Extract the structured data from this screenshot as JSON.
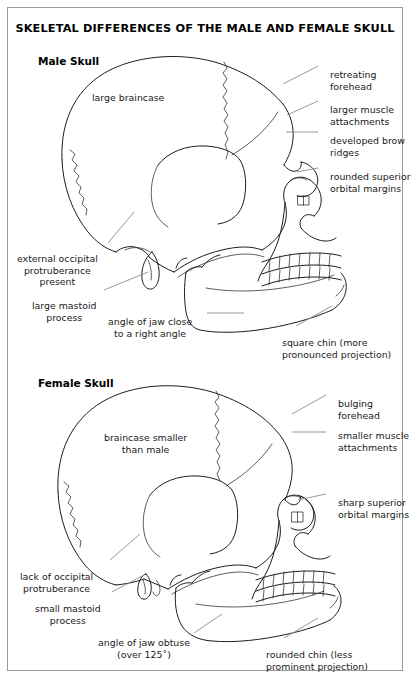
{
  "figure": {
    "title": "SKELETAL DIFFERENCES OF THE MALE AND FEMALE SKULL",
    "border_color": "#9a9a9a",
    "ink_color": "#1d1d1d",
    "leader_color": "#8d8d8d",
    "background": "#ffffff"
  },
  "panels": [
    {
      "id": "male",
      "heading": "Male Skull",
      "internal_labels": [
        {
          "name": "large-braincase",
          "text": "large braincase"
        }
      ],
      "callouts": [
        {
          "name": "retreating-forehead",
          "text": "retreating\nforehead",
          "side": "right"
        },
        {
          "name": "larger-muscle-attachments",
          "text": "larger muscle\nattachments",
          "side": "right"
        },
        {
          "name": "developed-brow-ridges",
          "text": "developed brow\nridges",
          "side": "right"
        },
        {
          "name": "rounded-superior-orbital-margins",
          "text": "rounded superior\norbital margins",
          "side": "right"
        },
        {
          "name": "external-occipital-protruberance",
          "text": "external occipital\nprotruberance\npresent",
          "side": "left"
        },
        {
          "name": "large-mastoid-process",
          "text": "large mastoid\nprocess",
          "side": "left"
        },
        {
          "name": "angle-of-jaw-right-angle",
          "text": "angle of jaw close\nto a right angle",
          "side": "left"
        },
        {
          "name": "square-chin",
          "text": "square chin (more\npronounced projection)",
          "side": "right"
        }
      ]
    },
    {
      "id": "female",
      "heading": "Female Skull",
      "internal_labels": [
        {
          "name": "braincase-smaller-than-male",
          "text": "braincase smaller\nthan male"
        }
      ],
      "callouts": [
        {
          "name": "bulging-forehead",
          "text": "bulging\nforehead",
          "side": "right"
        },
        {
          "name": "smaller-muscle-attachments",
          "text": "smaller muscle\nattachments",
          "side": "right"
        },
        {
          "name": "sharp-superior-orbital-margins",
          "text": "sharp superior\norbital margins",
          "side": "right"
        },
        {
          "name": "lack-of-occipital-protruberance",
          "text": "lack of occipital\nprotruberance",
          "side": "left"
        },
        {
          "name": "small-mastoid-process",
          "text": "small mastoid\nprocess",
          "side": "left"
        },
        {
          "name": "angle-of-jaw-obtuse",
          "text": "angle of jaw obtuse\n(over 125˚)",
          "side": "left"
        },
        {
          "name": "rounded-chin",
          "text": "rounded chin (less\nprominent projection)",
          "side": "right"
        }
      ]
    }
  ]
}
